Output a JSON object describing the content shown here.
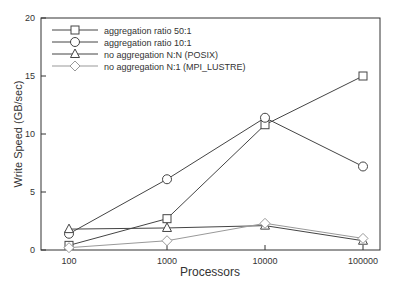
{
  "chart_data": {
    "type": "line",
    "title": "",
    "xlabel": "Processors",
    "ylabel": "Write Speed (GB/sec)",
    "xscale": "log",
    "x": [
      100,
      1000,
      10000,
      100000
    ],
    "x_tick_labels": [
      "100",
      "1000",
      "10000",
      "100000"
    ],
    "ylim": [
      0,
      20
    ],
    "y_ticks": [
      0,
      5,
      10,
      15,
      20
    ],
    "grid": false,
    "legend_position": "upper left",
    "series": [
      {
        "name": "aggregation ratio 50:1",
        "marker": "square",
        "color": "#444444",
        "values": [
          0.4,
          2.7,
          10.8,
          15.0
        ]
      },
      {
        "name": "aggregation ratio 10:1",
        "marker": "circle",
        "color": "#444444",
        "values": [
          1.4,
          6.1,
          11.4,
          7.2
        ]
      },
      {
        "name": "no aggregation N:N (POSIX)",
        "marker": "triangle",
        "color": "#444444",
        "values": [
          1.8,
          1.9,
          2.1,
          0.8
        ]
      },
      {
        "name": "no aggregation N:1 (MPI_LUSTRE)",
        "marker": "diamond",
        "color": "#999999",
        "values": [
          0.2,
          0.8,
          2.3,
          1.0
        ]
      }
    ]
  }
}
